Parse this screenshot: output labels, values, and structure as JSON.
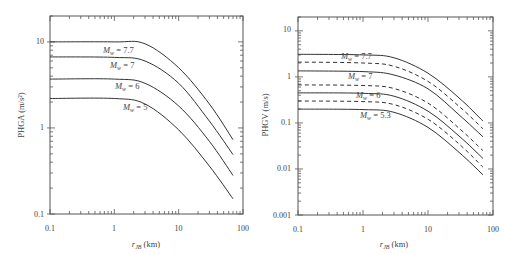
{
  "chart_data": [
    {
      "type": "line",
      "title": "",
      "xlabel": "r_JB (km)",
      "ylabel": "PHGA (m/s²)",
      "xscale": "log",
      "yscale": "log",
      "xlim": [
        0.1,
        100
      ],
      "ylim": [
        0.1,
        20
      ],
      "xticks": [
        "0.1",
        "1",
        "10",
        "100"
      ],
      "yticks": [
        "0.1",
        "1",
        "10"
      ],
      "grid": false,
      "x": [
        0.1,
        1,
        3,
        10,
        30,
        70
      ],
      "series": [
        {
          "name": "M_w = 7.7",
          "style": "solid",
          "values": [
            10.0,
            10.0,
            9.5,
            5.0,
            1.9,
            0.73
          ]
        },
        {
          "name": "M_w = 7",
          "style": "solid",
          "values": [
            6.7,
            6.6,
            6.0,
            3.3,
            1.2,
            0.49
          ]
        },
        {
          "name": "M_w = 6",
          "style": "solid",
          "values": [
            3.7,
            3.7,
            3.3,
            1.8,
            0.7,
            0.28
          ]
        },
        {
          "name": "M_w = 5",
          "style": "solid",
          "values": [
            2.2,
            2.2,
            1.9,
            0.95,
            0.36,
            0.15
          ]
        }
      ]
    },
    {
      "type": "line",
      "title": "",
      "xlabel": "r_JB (km)",
      "ylabel": "PHGV (m/s)",
      "xscale": "log",
      "yscale": "log",
      "xlim": [
        0.1,
        100
      ],
      "ylim": [
        0.001,
        20
      ],
      "xticks": [
        "0.1",
        "1",
        "10",
        "100"
      ],
      "yticks": [
        "0.001",
        "0.01",
        "0.1",
        "1",
        "10"
      ],
      "grid": false,
      "x": [
        0.1,
        1,
        3,
        10,
        30,
        70
      ],
      "series": [
        {
          "name": "M_w = 7.7",
          "style": "solid",
          "values": [
            3.1,
            3.0,
            2.6,
            1.2,
            0.35,
            0.11
          ]
        },
        {
          "name": "M_w = 7.7 (dashed)",
          "style": "dashed",
          "values": [
            2.1,
            2.0,
            1.7,
            0.8,
            0.23,
            0.075
          ]
        },
        {
          "name": "M_w = 7",
          "style": "solid",
          "values": [
            1.35,
            1.3,
            1.1,
            0.55,
            0.15,
            0.05
          ]
        },
        {
          "name": "M_w = 7 (dashed)",
          "style": "dashed",
          "values": [
            0.67,
            0.65,
            0.56,
            0.27,
            0.077,
            0.025
          ]
        },
        {
          "name": "M_w = 6",
          "style": "solid",
          "values": [
            0.45,
            0.44,
            0.38,
            0.18,
            0.052,
            0.017
          ]
        },
        {
          "name": "M_w = 6 (dashed)",
          "style": "dashed",
          "values": [
            0.3,
            0.29,
            0.25,
            0.12,
            0.035,
            0.011
          ]
        },
        {
          "name": "M_w = 5.3",
          "style": "solid",
          "values": [
            0.2,
            0.195,
            0.17,
            0.08,
            0.023,
            0.0075
          ]
        }
      ]
    }
  ],
  "left": {
    "ylabel": "PHGA (m/s²)",
    "xlabel_main": "r",
    "xlabel_sub": "JB",
    "xlabel_unit": " (km)",
    "xticks": [
      "0.1",
      "1",
      "10",
      "100"
    ],
    "yticks": [
      "0.1",
      "1",
      "10"
    ],
    "labels": [
      {
        "main": "M",
        "sub": "w",
        "val": " = 7.7"
      },
      {
        "main": "M",
        "sub": "w",
        "val": " = 7"
      },
      {
        "main": "M",
        "sub": "w",
        "val": " = 6"
      },
      {
        "main": "M",
        "sub": "w",
        "val": " = 5"
      }
    ]
  },
  "right": {
    "ylabel": "PHGV (m/s)",
    "xlabel_main": "r",
    "xlabel_sub": "JB",
    "xlabel_unit": " (km)",
    "xticks": [
      "0.1",
      "1",
      "10",
      "100"
    ],
    "yticks": [
      "0.001",
      "0.01",
      "0.1",
      "1",
      "10"
    ],
    "labels": [
      {
        "main": "M",
        "sub": "w",
        "val": " = 7.7"
      },
      {
        "main": "M",
        "sub": "w",
        "val": " = 7"
      },
      {
        "main": "M",
        "sub": "w",
        "val": " = 6"
      },
      {
        "main": "M",
        "sub": "w",
        "val": " = 5.3"
      }
    ]
  }
}
